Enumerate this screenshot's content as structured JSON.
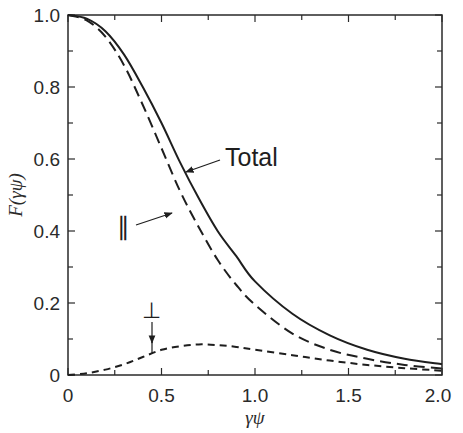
{
  "chart_data": {
    "type": "line",
    "title": "",
    "xlabel": "γψ",
    "ylabel": "F(γψ)",
    "xlim": [
      0,
      2.0
    ],
    "ylim": [
      0,
      1.0
    ],
    "grid": false,
    "legend_position": "none (inline annotations)",
    "x_ticks": [
      "0",
      "0.5",
      "1.0",
      "1.5",
      "2.0"
    ],
    "y_ticks": [
      "0",
      "0.2",
      "0.4",
      "0.6",
      "0.8",
      "1.0"
    ],
    "x": [
      0,
      0.1,
      0.2,
      0.3,
      0.4,
      0.5,
      0.6,
      0.7,
      0.8,
      0.9,
      1.0,
      1.2,
      1.4,
      1.6,
      1.8,
      2.0
    ],
    "series": [
      {
        "name": "Total",
        "style": "solid",
        "values": [
          1.0,
          0.99,
          0.955,
          0.89,
          0.8,
          0.7,
          0.59,
          0.49,
          0.4,
          0.33,
          0.26,
          0.17,
          0.11,
          0.07,
          0.045,
          0.03
        ]
      },
      {
        "name": "∥",
        "style": "long-dash",
        "values": [
          1.0,
          0.985,
          0.94,
          0.86,
          0.75,
          0.63,
          0.51,
          0.41,
          0.32,
          0.25,
          0.195,
          0.115,
          0.07,
          0.045,
          0.028,
          0.018
        ]
      },
      {
        "name": "⊥",
        "style": "short-dash",
        "values": [
          0,
          0.005,
          0.015,
          0.03,
          0.05,
          0.07,
          0.08,
          0.085,
          0.083,
          0.078,
          0.07,
          0.055,
          0.04,
          0.028,
          0.019,
          0.012
        ]
      }
    ],
    "annotations": [
      {
        "text": "Total",
        "points_to": "solid curve near γψ≈0.63"
      },
      {
        "text": "∥",
        "points_to": "long-dash curve near γψ≈0.55"
      },
      {
        "text": "⊥",
        "points_to": "short-dash curve near γψ≈0.47"
      }
    ]
  },
  "labels": {
    "total": "Total",
    "parallel": "∥",
    "perpendicular": "⊥",
    "xlabel": "γψ",
    "ylabel": "F(γψ)"
  },
  "ticks": {
    "x": [
      "0",
      "0.5",
      "1.0",
      "1.5",
      "2.0"
    ],
    "y": [
      "0",
      "0.2",
      "0.4",
      "0.6",
      "0.8",
      "1.0"
    ]
  }
}
